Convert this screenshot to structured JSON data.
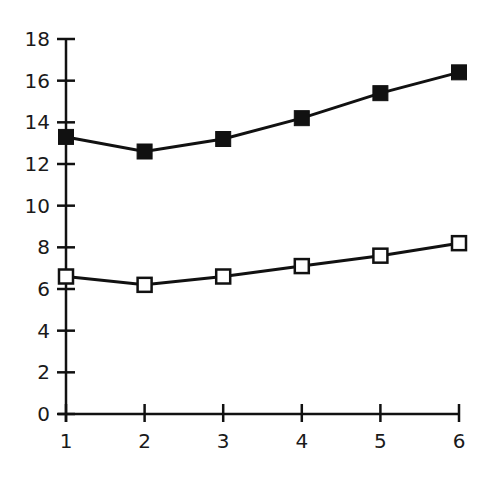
{
  "chart_data": {
    "type": "line",
    "title": "",
    "xlabel": "",
    "ylabel": "",
    "x": [
      1,
      2,
      3,
      4,
      5,
      6
    ],
    "xticks": [
      "1",
      "2",
      "3",
      "4",
      "5",
      "6"
    ],
    "yticks": [
      "0",
      "2",
      "4",
      "6",
      "8",
      "10",
      "12",
      "14",
      "16",
      "18"
    ],
    "ylim": [
      0,
      18
    ],
    "grid": false,
    "legend": null,
    "series": [
      {
        "name": "filled-squares",
        "marker": "filled-square",
        "values": [
          13.3,
          12.6,
          13.2,
          14.2,
          15.4,
          16.4
        ]
      },
      {
        "name": "open-squares",
        "marker": "open-square",
        "values": [
          6.6,
          6.2,
          6.6,
          7.1,
          7.6,
          8.2
        ]
      }
    ],
    "colors": {
      "line": "#111111",
      "marker_fill_filled": "#111111",
      "marker_fill_open": "#ffffff"
    }
  }
}
